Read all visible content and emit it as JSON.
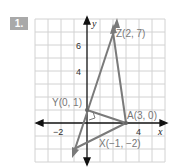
{
  "problem": {
    "number": "1."
  },
  "axes": {
    "x_label": "x",
    "y_label": "y",
    "x_ticks": [
      "−2",
      "4"
    ],
    "y_ticks": [
      "6",
      "4"
    ]
  },
  "points": [
    {
      "name": "Z",
      "label": "Z(2, 7)",
      "x": 2,
      "y": 7
    },
    {
      "name": "Y",
      "label": "Y(0, 1)",
      "x": 0,
      "y": 1
    },
    {
      "name": "A",
      "label": "A(3, 0)",
      "x": 3,
      "y": 0
    },
    {
      "name": "X",
      "label": "X(−1, −2)",
      "x": -1,
      "y": -2
    }
  ],
  "colors": {
    "grid": "#cfcfcf",
    "lines": "#7a7a7a",
    "badge": "#a9a9a9"
  }
}
